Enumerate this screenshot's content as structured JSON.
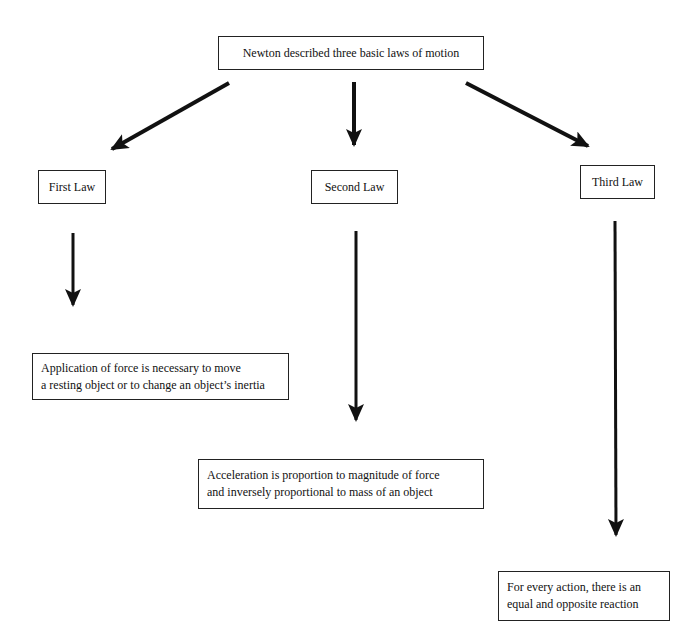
{
  "diagram": {
    "root": {
      "label": "Newton described three basic laws of motion"
    },
    "laws": [
      {
        "title": "First Law",
        "description": [
          "Application of force is necessary to move",
          "a resting object or to change an object’s inertia"
        ]
      },
      {
        "title": "Second Law",
        "description": [
          "Acceleration is proportion to magnitude of force",
          "and inversely proportional to mass of an object"
        ]
      },
      {
        "title": "Third Law",
        "description": [
          "For every action, there is an",
          "equal and opposite reaction"
        ]
      }
    ],
    "colors": {
      "line": "#111111",
      "background": "#ffffff"
    }
  }
}
